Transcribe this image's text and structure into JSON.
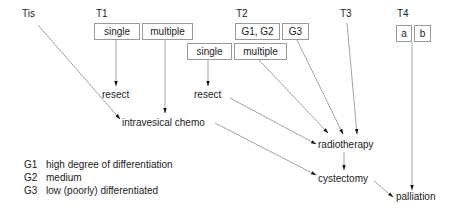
{
  "stages": {
    "tis": "Tis",
    "t1": "T1",
    "t2": "T2",
    "t3": "T3",
    "t4": "T4"
  },
  "boxes": {
    "t1_single": "single",
    "t1_multiple": "multiple",
    "t2_g1g2": "G1, G2",
    "t2_g3": "G3",
    "t2_single": "single",
    "t2_multiple": "multiple",
    "t4_a": "a",
    "t4_b": "b"
  },
  "nodes": {
    "resect_t1": "resect",
    "resect_t2": "resect",
    "intravesical_chemo": "intravesical chemo",
    "radiotherapy": "radiotherapy",
    "cystectomy": "cystectomy",
    "palliation": "palliation"
  },
  "edges": [
    {
      "from": "Tis",
      "to": "intravesical chemo"
    },
    {
      "from": "T1 single",
      "to": "resect"
    },
    {
      "from": "T1 multiple",
      "to": "intravesical chemo"
    },
    {
      "from": "T2 single",
      "to": "resect"
    },
    {
      "from": "resect (T2)",
      "to": "radiotherapy"
    },
    {
      "from": "T2 multiple",
      "to": "radiotherapy"
    },
    {
      "from": "G3",
      "to": "radiotherapy"
    },
    {
      "from": "T3",
      "to": "radiotherapy"
    },
    {
      "from": "intravesical chemo",
      "to": "cystectomy"
    },
    {
      "from": "radiotherapy",
      "to": "cystectomy"
    },
    {
      "from": "cystectomy",
      "to": "palliation"
    },
    {
      "from": "T4 a/b",
      "to": "palliation"
    }
  ],
  "legend": [
    {
      "code": "G1",
      "text": "high degree of differentiation"
    },
    {
      "code": "G2",
      "text": "medium"
    },
    {
      "code": "G3",
      "text": "low (poorly) differentiated"
    }
  ]
}
